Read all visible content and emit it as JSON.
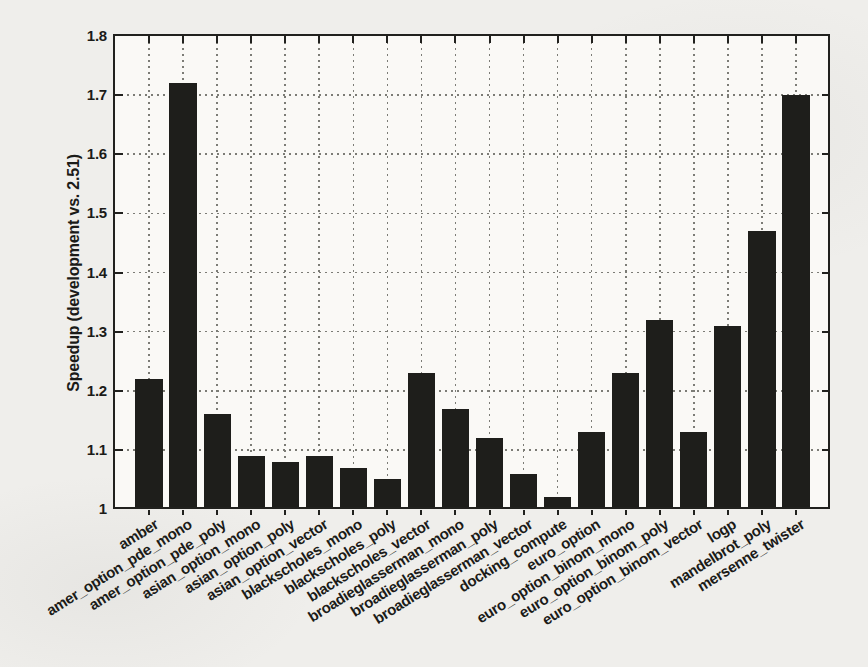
{
  "figure": {
    "background_color": "#efeeeb",
    "plot_background_color": "#faf9f6",
    "axis_color": "#21211e",
    "grid_color": "#7c7c76",
    "text_color": "#1b1b18"
  },
  "chart_data": {
    "type": "bar",
    "title": "",
    "xlabel": "",
    "ylabel": "Speedup (development vs. 2.51)",
    "ylim": [
      1.0,
      1.8
    ],
    "ytick_step": 0.1,
    "ytick_labels": [
      "1",
      "1.1",
      "1.2",
      "1.3",
      "1.4",
      "1.5",
      "1.6",
      "1.7",
      "1.8"
    ],
    "grid": true,
    "legend": "none",
    "bar_color": "#1e1e1b",
    "bar_width_fraction": 0.8,
    "categories": [
      "amber",
      "amer_option_pde_mono",
      "amer_option_pde_poly",
      "asian_option_mono",
      "asian_option_poly",
      "asian_option_vector",
      "blackscholes_mono",
      "blackscholes_poly",
      "blackscholes_vector",
      "broadieglasserman_mono",
      "broadieglasserman_poly",
      "broadieglasserman_vector",
      "docking_compute",
      "euro_option",
      "euro_option_binom_mono",
      "euro_option_binom_poly",
      "euro_option_binom_vector",
      "logp",
      "mandelbrot_poly",
      "mersenne_twister"
    ],
    "values": [
      1.22,
      1.72,
      1.16,
      1.09,
      1.08,
      1.09,
      1.07,
      1.05,
      1.23,
      1.17,
      1.12,
      1.06,
      1.02,
      1.13,
      1.23,
      1.32,
      1.13,
      1.31,
      1.47,
      1.7
    ]
  }
}
